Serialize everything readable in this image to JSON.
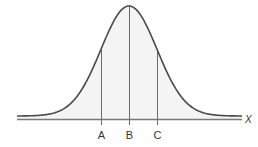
{
  "diagram": {
    "type": "normal-distribution-curve",
    "axis_label": "X",
    "markers": [
      {
        "label": "A",
        "x_px": 101
      },
      {
        "label": "B",
        "x_px": 129
      },
      {
        "label": "C",
        "x_px": 157
      }
    ],
    "mean_px": 129,
    "sigma_px": 28,
    "baseline_y": 119,
    "peak_y": 6,
    "x_start": 17,
    "x_end": 242,
    "colors": {
      "curve": "#4a4a4a",
      "axis": "#7a7a7a",
      "fill": "#f4f4f4",
      "lines": "#6a6a6a"
    }
  }
}
